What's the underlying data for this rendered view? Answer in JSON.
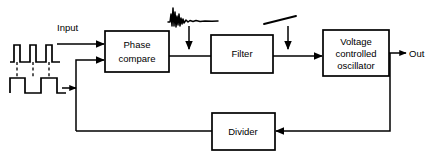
{
  "diagram": {
    "stroke_color": "#000000",
    "background_color": "#ffffff",
    "blocks": [
      {
        "id": "phase-compare",
        "label_line1": "Phase",
        "label_line2": "compare"
      },
      {
        "id": "filter",
        "label_line1": "Filter",
        "label_line2": ""
      },
      {
        "id": "vco",
        "label_line1": "Voltage",
        "label_line2": "controlled",
        "label_line3": "oscillator"
      },
      {
        "id": "divider",
        "label_line1": "Divider",
        "label_line2": ""
      }
    ],
    "labels": {
      "input": "Input",
      "output": "Out"
    },
    "signals": [
      {
        "id": "input-pulse-waveform",
        "name": "pulse-train-waveform",
        "pulses": 3
      },
      {
        "id": "input-square-waveform",
        "name": "square-wave-waveform",
        "cycles": 2
      },
      {
        "id": "noise-waveform",
        "name": "noise-burst-waveform"
      },
      {
        "id": "drift-waveform",
        "name": "slow-ramp-waveform"
      }
    ],
    "connections": [
      {
        "from": "input",
        "to": "phase-compare"
      },
      {
        "from": "divider",
        "to": "phase-compare"
      },
      {
        "from": "phase-compare",
        "to": "filter"
      },
      {
        "from": "noise-waveform",
        "to": "phase-compare-filter-link"
      },
      {
        "from": "filter",
        "to": "vco"
      },
      {
        "from": "drift-waveform",
        "to": "filter-vco-link"
      },
      {
        "from": "vco",
        "to": "output"
      },
      {
        "from": "vco",
        "to": "divider"
      }
    ]
  }
}
